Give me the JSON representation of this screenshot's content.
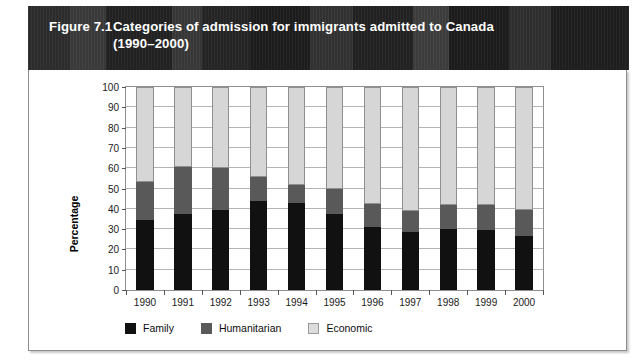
{
  "figure": {
    "number": "Figure 7.1",
    "title_line1": "Categories of admission for immigrants admitted to Canada",
    "title_line2": "(1990–2000)"
  },
  "chart_data": {
    "type": "bar",
    "subtype": "stacked-100-percent",
    "title": "Categories of admission for immigrants admitted to Canada (1990–2000)",
    "xlabel": "",
    "ylabel": "Percentage",
    "ylim": [
      0,
      100
    ],
    "ytick_step": 10,
    "yticks": [
      0,
      10,
      20,
      30,
      40,
      50,
      60,
      70,
      80,
      90,
      100
    ],
    "grid": true,
    "legend_position": "bottom-left",
    "categories": [
      "1990",
      "1991",
      "1992",
      "1993",
      "1994",
      "1995",
      "1996",
      "1997",
      "1998",
      "1999",
      "2000"
    ],
    "series": [
      {
        "name": "Family",
        "color": "#111111",
        "values": [
          34.5,
          37.5,
          39.5,
          44,
          43,
          37.5,
          31,
          28.5,
          30,
          29.5,
          26.5
        ]
      },
      {
        "name": "Humanitarian",
        "color": "#595959",
        "values": [
          18.5,
          23,
          20.5,
          11.5,
          8.5,
          12.5,
          11.5,
          10.5,
          12,
          12.5,
          13
        ]
      },
      {
        "name": "Economic",
        "color": "#d6d6d6",
        "values": [
          47,
          39.5,
          40,
          44.5,
          48.5,
          50,
          57.5,
          61,
          58,
          58,
          60.5
        ]
      }
    ],
    "cumulative_tops": {
      "family": [
        34.5,
        37.5,
        39.5,
        44,
        43,
        37.5,
        31,
        28.5,
        30,
        29.5,
        26.5
      ],
      "humanitarian": [
        53,
        60.5,
        60,
        55.5,
        51.5,
        50,
        42.5,
        39,
        42,
        42,
        39.5
      ],
      "economic": [
        100,
        100,
        100,
        100,
        100,
        100,
        100,
        100,
        100,
        100,
        100
      ]
    }
  },
  "legend": {
    "items": [
      {
        "label": "Family",
        "swatch": "legend-swatch-family"
      },
      {
        "label": "Humanitarian",
        "swatch": "legend-swatch-humanitarian"
      },
      {
        "label": "Economic",
        "swatch": "legend-swatch-economic"
      }
    ]
  },
  "colors": {
    "banner": "#272727",
    "banner_text": "#ffffff",
    "family": "#111111",
    "humanitarian": "#595959",
    "economic": "#d6d6d6",
    "gridline": "#b4b4b4",
    "frame": "#8d8d8d"
  }
}
